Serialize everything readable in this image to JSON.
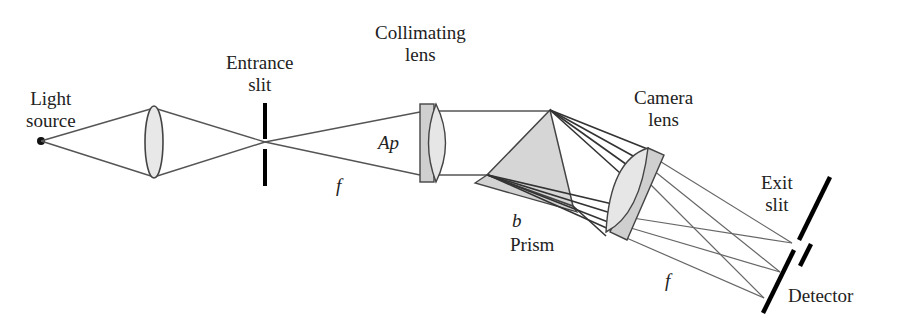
{
  "diagram": {
    "type": "prism spectrometer optical layout",
    "labels": {
      "light_source": [
        "Light",
        "source"
      ],
      "entrance_slit": [
        "Entrance",
        "slit"
      ],
      "collimating_lens": [
        "Collimating",
        "lens"
      ],
      "camera_lens": [
        "Camera",
        "lens"
      ],
      "exit_slit": [
        "Exit",
        "slit"
      ],
      "prism": "Prism",
      "detector": "Detector",
      "aperture_symbol": "Ap",
      "focal_length_symbol_1": "f",
      "focal_length_symbol_2": "f",
      "prism_base_symbol": "b"
    },
    "colors": {
      "line": "#444444",
      "glass_fill": "#d8d8d8",
      "lens_fill": "#e6e6e6",
      "slit": "#000000"
    }
  }
}
